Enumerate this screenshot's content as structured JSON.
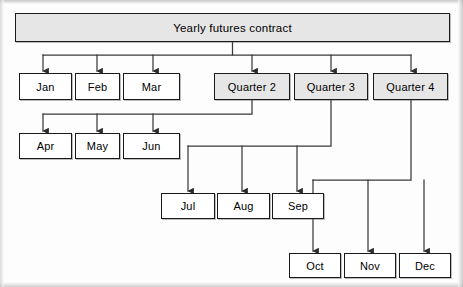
{
  "diagram": {
    "type": "tree-hierarchy",
    "colors": {
      "shaded_fill": "#e6e6e6",
      "plain_fill": "#ffffff",
      "border": "#1a1a1a",
      "connector": "#3a3a3a",
      "background": "#fdfdfd"
    },
    "root": {
      "label": "Yearly futures contract",
      "shaded": true,
      "x": 15,
      "y": 13,
      "w": 435,
      "h": 29
    },
    "nodes": [
      {
        "id": "jan",
        "label": "Jan",
        "shaded": false,
        "x": 19,
        "y": 73,
        "w": 53,
        "h": 27
      },
      {
        "id": "feb",
        "label": "Feb",
        "shaded": false,
        "x": 75,
        "y": 73,
        "w": 45,
        "h": 27
      },
      {
        "id": "mar",
        "label": "Mar",
        "shaded": false,
        "x": 123,
        "y": 73,
        "w": 57,
        "h": 27
      },
      {
        "id": "q2",
        "label": "Quarter 2",
        "shaded": true,
        "x": 214,
        "y": 73,
        "w": 76,
        "h": 27
      },
      {
        "id": "q3",
        "label": "Quarter 3",
        "shaded": true,
        "x": 294,
        "y": 73,
        "w": 74,
        "h": 27
      },
      {
        "id": "q4",
        "label": "Quarter 4",
        "shaded": true,
        "x": 373,
        "y": 73,
        "w": 75,
        "h": 27
      },
      {
        "id": "apr",
        "label": "Apr",
        "shaded": false,
        "x": 19,
        "y": 133,
        "w": 53,
        "h": 26
      },
      {
        "id": "may",
        "label": "May",
        "shaded": false,
        "x": 75,
        "y": 133,
        "w": 45,
        "h": 26
      },
      {
        "id": "jun",
        "label": "Jun",
        "shaded": false,
        "x": 123,
        "y": 133,
        "w": 57,
        "h": 26
      },
      {
        "id": "jul",
        "label": "Jul",
        "shaded": false,
        "x": 161,
        "y": 193,
        "w": 54,
        "h": 26
      },
      {
        "id": "aug",
        "label": "Aug",
        "shaded": false,
        "x": 217,
        "y": 193,
        "w": 53,
        "h": 26
      },
      {
        "id": "sep",
        "label": "Sep",
        "shaded": false,
        "x": 272,
        "y": 193,
        "w": 52,
        "h": 26
      },
      {
        "id": "oct",
        "label": "Oct",
        "shaded": false,
        "x": 289,
        "y": 253,
        "w": 52,
        "h": 25
      },
      {
        "id": "nov",
        "label": "Nov",
        "shaded": false,
        "x": 344,
        "y": 253,
        "w": 52,
        "h": 25
      },
      {
        "id": "dec",
        "label": "Dec",
        "shaded": false,
        "x": 399,
        "y": 253,
        "w": 52,
        "h": 25
      }
    ],
    "edges": [
      {
        "from": "root",
        "to": "jan"
      },
      {
        "from": "root",
        "to": "feb"
      },
      {
        "from": "root",
        "to": "mar"
      },
      {
        "from": "root",
        "to": "q2"
      },
      {
        "from": "root",
        "to": "q3"
      },
      {
        "from": "root",
        "to": "q4"
      },
      {
        "from": "q2",
        "to": "apr"
      },
      {
        "from": "q2",
        "to": "may"
      },
      {
        "from": "q2",
        "to": "jun"
      },
      {
        "from": "q3",
        "to": "jul"
      },
      {
        "from": "q3",
        "to": "aug"
      },
      {
        "from": "q3",
        "to": "sep"
      },
      {
        "from": "q4",
        "to": "oct"
      },
      {
        "from": "q4",
        "to": "nov"
      },
      {
        "from": "q4",
        "to": "dec"
      }
    ]
  }
}
